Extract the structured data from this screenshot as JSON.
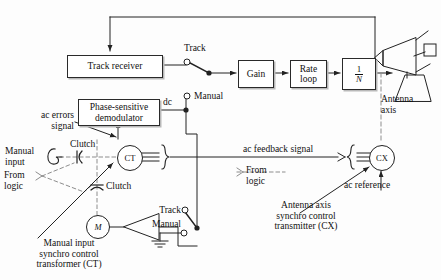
{
  "diagram": {
    "blocks": [
      {
        "id": "track_receiver",
        "label": "Track receiver"
      },
      {
        "id": "phase_sensitive_demodulator",
        "label": "Phase-sensitive\ndemodulator"
      },
      {
        "id": "gain",
        "label": "Gain"
      },
      {
        "id": "rate_loop",
        "label": "Rate\nloop"
      },
      {
        "id": "one_over_n",
        "numerator": "1",
        "denominator": "N"
      }
    ],
    "components": [
      {
        "id": "ct",
        "label": "CT"
      },
      {
        "id": "cx",
        "label": "CX"
      },
      {
        "id": "motor",
        "label": "M"
      }
    ],
    "labels": {
      "track_upper": "Track",
      "manual_upper": "Manual",
      "dc": "dc",
      "track_lower": "Track",
      "manual_lower": "Manual",
      "ac_errors_signal": "ac errors\nsignal",
      "manual_input": "Manual\ninput",
      "from_logic_left": "From\nlogic",
      "from_logic_right": "From\nlogic",
      "clutch_upper": "Clutch",
      "clutch_lower": "Clutch",
      "ac_feedback_signal": "ac feedback signal",
      "ac_reference": "ac reference",
      "antenna_axis": "Antenna\naxis",
      "caption_ct": "Manual input\nsynchro control\ntransformer (CT)",
      "caption_cx": "Antenna axis\nsynchro control\ntransmitter (CX)"
    },
    "colors": {
      "line": "#222222",
      "dashed": "#888888",
      "shadow": "#b9b9b9",
      "background": "#fdfdfd"
    }
  }
}
